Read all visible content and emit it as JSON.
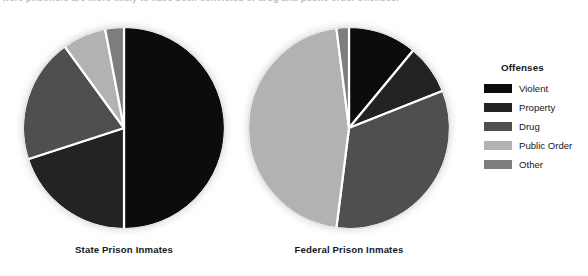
{
  "caption": {
    "text": "were prisoners are more likely to have been convicted of drug and public order offenses."
  },
  "legend": {
    "title": "Offenses",
    "items": [
      {
        "label": "Violent",
        "color": "#0c0c0c"
      },
      {
        "label": "Property",
        "color": "#232323"
      },
      {
        "label": "Drug",
        "color": "#4f4f4f"
      },
      {
        "label": "Public Order",
        "color": "#b2b2b2"
      },
      {
        "label": "Other",
        "color": "#7d7d7d"
      }
    ]
  },
  "chart_data": [
    {
      "type": "pie",
      "title": "State Prison Inmates",
      "categories": [
        "Violent",
        "Property",
        "Drug",
        "Public Order",
        "Other"
      ],
      "values": [
        50,
        20,
        20,
        7,
        3
      ],
      "colors": [
        "#0c0c0c",
        "#232323",
        "#4f4f4f",
        "#b2b2b2",
        "#7d7d7d"
      ],
      "start_angle": 0,
      "direction": "clockwise",
      "legend_position": "right",
      "grid": false
    },
    {
      "type": "pie",
      "title": "Federal Prison Inmates",
      "categories": [
        "Violent",
        "Property",
        "Drug",
        "Public Order",
        "Other"
      ],
      "values": [
        11,
        8,
        33,
        46,
        2
      ],
      "colors": [
        "#0c0c0c",
        "#232323",
        "#4f4f4f",
        "#b2b2b2",
        "#7d7d7d"
      ],
      "start_angle": 0,
      "direction": "clockwise",
      "legend_position": "right",
      "grid": false
    }
  ]
}
